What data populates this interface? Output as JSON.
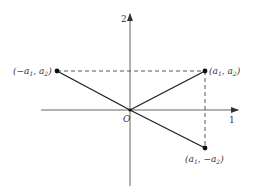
{
  "diagram": {
    "type": "coordinate-plane",
    "axes": {
      "horizontal_label": "1",
      "vertical_label": "2",
      "origin_label": "O"
    },
    "points": [
      {
        "id": "p_left",
        "label_main": "(−a",
        "sub1": "1",
        "mid": ", a",
        "sub2": "2",
        "close": ")"
      },
      {
        "id": "p_right",
        "label_main": "(a",
        "sub1": "1",
        "mid": ", a",
        "sub2": "2",
        "close": ")"
      },
      {
        "id": "p_bottom",
        "label_main": "(a",
        "sub1": "1",
        "mid": ", −a",
        "sub2": "2",
        "close": ")"
      }
    ],
    "colors": {
      "line": "#222222",
      "axis": "#444444",
      "text": "#333333"
    }
  }
}
